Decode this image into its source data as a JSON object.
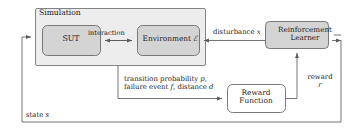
{
  "diagram": {
    "colors": {
      "container_fill": "#ededed",
      "node_fill": "#d4d4d4",
      "plain_fill": "#ffffff",
      "stroke": "#6f6f6f",
      "text": "#1a1a1a",
      "background": "#ffffff"
    },
    "nodes": {
      "simulation": {
        "label": "Simulation",
        "kind": "container"
      },
      "sut": {
        "label": "SUT",
        "kind": "process"
      },
      "environment": {
        "label": "Environment",
        "symbol": "ℰ",
        "kind": "process"
      },
      "reinforcement_learner": {
        "line1": "Reinforcement",
        "line2": "Learner",
        "kind": "process"
      },
      "reward_function": {
        "line1": "Reward",
        "line2": "Function",
        "kind": "process"
      }
    },
    "edges": {
      "interaction": {
        "label": "interaction",
        "from": "sut",
        "to": "environment",
        "direction": "bidirectional"
      },
      "disturbance": {
        "label": "disturbance",
        "symbol": "x",
        "from": "reinforcement_learner",
        "to": "environment",
        "direction": "left"
      },
      "observation": {
        "line1_text": "transition probability",
        "line1_symbol": "p,",
        "line2_text_a": "failure event",
        "line2_symbol_a": "f",
        "line2_text_b": ", distance",
        "line2_symbol_b": "d",
        "from": "simulation",
        "to": "reward_function",
        "direction": "right"
      },
      "reward": {
        "line1": "reward",
        "line2": "r",
        "from": "reward_function",
        "to": "reinforcement_learner",
        "direction": "up"
      },
      "state": {
        "label": "state",
        "symbol": "s",
        "from": "reinforcement_learner",
        "to": "simulation",
        "direction": "left-loop"
      }
    }
  }
}
